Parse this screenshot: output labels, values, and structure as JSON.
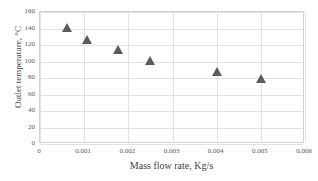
{
  "chart_data": {
    "type": "scatter",
    "title": "",
    "xlabel": "Mass flow rate, Kg/s",
    "ylabel": "Outlet temperature, °C",
    "xlim": [
      0,
      0.006
    ],
    "ylim": [
      0,
      160
    ],
    "grid": true,
    "legend": "none",
    "marker": "triangle",
    "marker_color": "#5c5c5c",
    "xticks": [
      "0",
      "0.001",
      "0.002",
      "0.003",
      "0.004",
      "0.005",
      "0.006"
    ],
    "xtick_values": [
      0,
      0.001,
      0.002,
      0.003,
      0.004,
      0.005,
      0.006
    ],
    "yticks": [
      "0",
      "20",
      "40",
      "60",
      "80",
      "100",
      "120",
      "140",
      "160"
    ],
    "ytick_values": [
      0,
      20,
      40,
      60,
      80,
      100,
      120,
      140,
      160
    ],
    "series": [
      {
        "name": "Outlet temperature",
        "x": [
          0.0006,
          0.00106,
          0.00176,
          0.0025,
          0.004,
          0.005
        ],
        "y": [
          142,
          127,
          115,
          102,
          89,
          80
        ]
      }
    ]
  }
}
